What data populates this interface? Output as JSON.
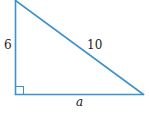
{
  "figure": {
    "type": "right-triangle",
    "stroke_color": "#3d92c9",
    "labels": {
      "vertical_leg": "6",
      "hypotenuse": "10",
      "base": "a"
    },
    "right_angle_marker": true
  }
}
